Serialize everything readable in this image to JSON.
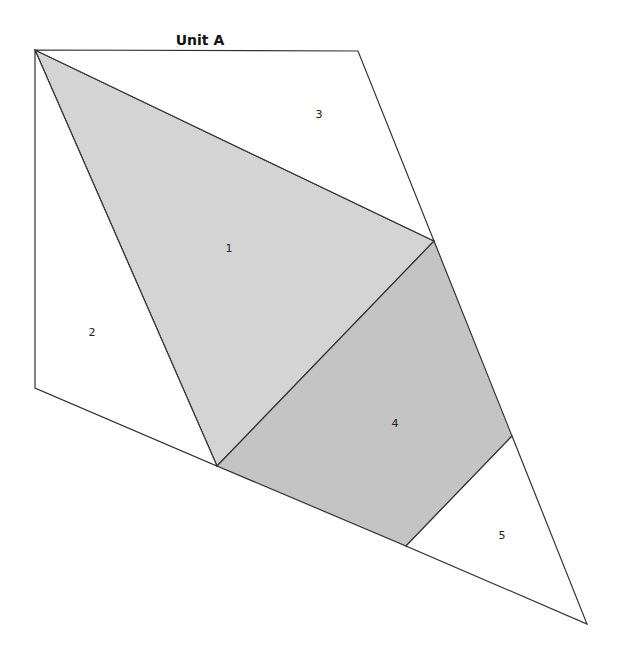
{
  "title": "Unit A",
  "colors": {
    "piece1": "#d4d4d4",
    "piece4": "#c4c4c4",
    "stroke": "#333333",
    "background": "#ffffff"
  },
  "pieces": [
    {
      "id": "1",
      "label": "1",
      "fill": "#d4d4d4",
      "points": "35,50 434,241 217,466",
      "label_x": 229,
      "label_y": 252
    },
    {
      "id": "2",
      "label": "2",
      "fill": "#ffffff",
      "points": "35,50 217,466 35,388",
      "label_x": 92,
      "label_y": 336
    },
    {
      "id": "3",
      "label": "3",
      "fill": "#ffffff",
      "points": "35,50 358,51 434,241",
      "label_x": 319,
      "label_y": 118
    },
    {
      "id": "4",
      "label": "4",
      "fill": "#c4c4c4",
      "points": "434,241 512,436 406,546 217,466",
      "label_x": 395,
      "label_y": 427
    },
    {
      "id": "5",
      "label": "5",
      "fill": "#ffffff",
      "points": "512,436 587,624 406,546",
      "label_x": 502,
      "label_y": 539
    }
  ]
}
